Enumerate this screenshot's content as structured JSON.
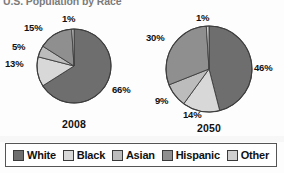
{
  "title": "U.S. Population by Race",
  "legend": {
    "items": [
      {
        "label": "White",
        "color": "#6e6e6e",
        "key": "white"
      },
      {
        "label": "Black",
        "color": "#d8d8d8",
        "key": "black"
      },
      {
        "label": "Asian",
        "color": "#bcbcbc",
        "key": "asian"
      },
      {
        "label": "Hispanic",
        "color": "#8f8f8f",
        "key": "hispanic"
      },
      {
        "label": "Other",
        "color": "#cfcfcf",
        "key": "other"
      }
    ]
  },
  "charts": [
    {
      "year": "2008",
      "labels": {
        "white": "66%",
        "black": "13%",
        "asian": "5%",
        "hispanic": "15%",
        "other": "1%"
      }
    },
    {
      "year": "2050",
      "labels": {
        "white": "46%",
        "black": "14%",
        "asian": "9%",
        "hispanic": "30%",
        "other": "1%"
      }
    }
  ],
  "chart_data": [
    {
      "type": "pie",
      "title": "2008",
      "categories": [
        "White",
        "Black",
        "Asian",
        "Hispanic",
        "Other"
      ],
      "values": [
        66,
        13,
        5,
        15,
        1
      ],
      "unit": "percent",
      "colors": [
        "#6e6e6e",
        "#d8d8d8",
        "#bcbcbc",
        "#8f8f8f",
        "#cfcfcf"
      ],
      "labels": [
        "66%",
        "13%",
        "5%",
        "15%",
        "1%"
      ],
      "legend_position": "bottom",
      "start_angle_deg": 0,
      "direction": "clockwise"
    },
    {
      "type": "pie",
      "title": "2050",
      "categories": [
        "White",
        "Black",
        "Asian",
        "Hispanic",
        "Other"
      ],
      "values": [
        46,
        14,
        9,
        30,
        1
      ],
      "unit": "percent",
      "colors": [
        "#6e6e6e",
        "#d8d8d8",
        "#bcbcbc",
        "#8f8f8f",
        "#cfcfcf"
      ],
      "labels": [
        "46%",
        "14%",
        "9%",
        "30%",
        "1%"
      ],
      "legend_position": "bottom",
      "start_angle_deg": 0,
      "direction": "clockwise"
    }
  ]
}
